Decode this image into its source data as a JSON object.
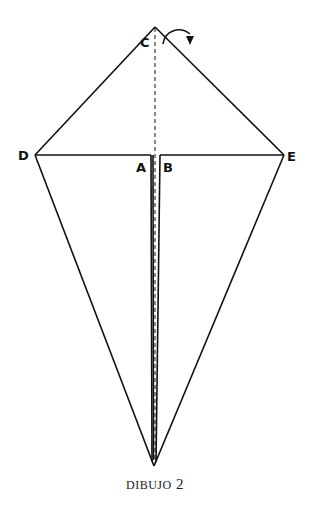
{
  "diagram": {
    "labels": {
      "c": "C",
      "d": "D",
      "a": "A",
      "b": "B",
      "e": "E"
    },
    "caption": {
      "word": "DIBUJO",
      "number": "2"
    }
  }
}
